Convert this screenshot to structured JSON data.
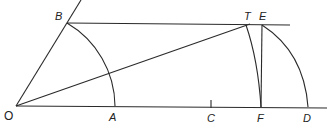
{
  "diagram": {
    "type": "geometric-construction",
    "points": {
      "O": {
        "label": "O",
        "x": 16,
        "y": 106
      },
      "A": {
        "label": "A",
        "x": 115,
        "y": 106
      },
      "B": {
        "label": "B",
        "x": 67,
        "y": 23
      },
      "T": {
        "label": "T",
        "x": 246,
        "y": 25
      },
      "E": {
        "label": "E",
        "x": 262,
        "y": 25
      },
      "C": {
        "label": "C",
        "x": 211,
        "y": 107
      },
      "F": {
        "label": "F",
        "x": 261,
        "y": 107
      },
      "D": {
        "label": "D",
        "x": 308,
        "y": 107
      }
    },
    "labels": {
      "O": "O",
      "A": "A",
      "B": "B",
      "T": "T",
      "E": "E",
      "C": "C",
      "F": "F",
      "D": "D"
    },
    "colors": {
      "stroke": "#2a2a2a",
      "background": "#ffffff"
    }
  }
}
